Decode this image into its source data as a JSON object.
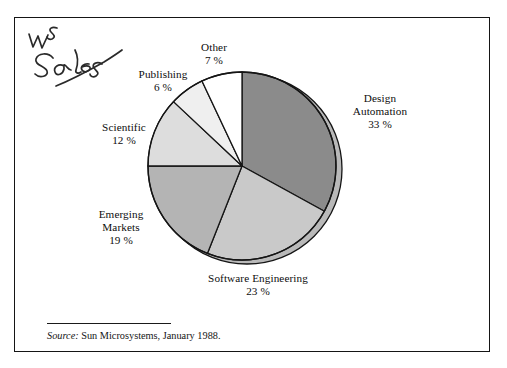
{
  "figure": {
    "annotation": "WS Sales",
    "source_label": "Source:",
    "source_text": "Sun Microsystems, January 1988."
  },
  "chart_data": {
    "type": "pie",
    "title": "",
    "subtitle": "",
    "xlabel": "",
    "ylabel": "",
    "legend_position": "none",
    "grid": false,
    "units": "percent",
    "total": 100,
    "start_angle_deg": 0,
    "direction": "clockwise",
    "categories": [
      "Design Automation",
      "Software Engineering",
      "Emerging Markets",
      "Scientific",
      "Publishing",
      "Other"
    ],
    "values": [
      33,
      23,
      19,
      12,
      6,
      7
    ],
    "labels": [
      "Design Automation",
      "Software Engineering",
      "Emerging Markets",
      "Scientific",
      "Publishing",
      "Other"
    ],
    "value_labels": [
      "33 %",
      "23 %",
      "19 %",
      "12 %",
      "6 %",
      "7 %"
    ],
    "colors": [
      "#8b8b8b",
      "#c9c9c9",
      "#b4b4b4",
      "#dddddd",
      "#efefef",
      "#ffffff"
    ],
    "slices": [
      {
        "label": "Design Automation",
        "value": 33,
        "value_label": "33 %",
        "color": "#8b8b8b"
      },
      {
        "label": "Software Engineering",
        "value": 23,
        "value_label": "23 %",
        "color": "#c9c9c9"
      },
      {
        "label": "Emerging Markets",
        "value": 19,
        "value_label": "19 %",
        "color": "#b4b4b4"
      },
      {
        "label": "Scientific",
        "value": 12,
        "value_label": "12 %",
        "color": "#dddddd"
      },
      {
        "label": "Publishing",
        "value": 6,
        "value_label": "6 %",
        "color": "#efefef"
      },
      {
        "label": "Other",
        "value": 7,
        "value_label": "7 %",
        "color": "#ffffff"
      }
    ]
  },
  "labels": {
    "design_name_line1": "Design",
    "design_name_line2": "Automation",
    "design_pct": "33 %",
    "software_name": "Software Engineering",
    "software_pct": "23 %",
    "emerging_name_line1": "Emerging",
    "emerging_name_line2": "Markets",
    "emerging_pct": "19 %",
    "scientific_name": "Scientific",
    "scientific_pct": "12 %",
    "publishing_name": "Publishing",
    "publishing_pct": "6 %",
    "other_name": "Other",
    "other_pct": "7 %"
  }
}
